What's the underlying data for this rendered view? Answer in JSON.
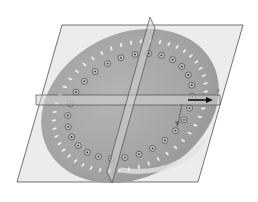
{
  "diagram": {
    "type": "3d-cad-view",
    "colors": {
      "background": "#ffffff",
      "plane_fill": "#e6e6e6",
      "plane_edge": "#3a3a3a",
      "disc_fill": "#a9a9a9",
      "disc_highlight": "#d8d8d8",
      "hole_ring": "#444444",
      "slot": "#ececec",
      "arrow": "#111111"
    },
    "axis_label": "z",
    "hole_count": 28,
    "slot_count": 48
  }
}
